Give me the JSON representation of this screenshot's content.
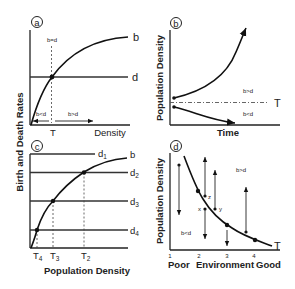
{
  "figure": {
    "shared_ylabel": "Birth and Death Rates",
    "panels": {
      "a": {
        "label": "a",
        "annot_equal": "b=d",
        "annot_less": "b<d",
        "annot_greater": "b>d",
        "curve_b": "b",
        "line_d": "d",
        "threshold": "T",
        "xlabel": "Density"
      },
      "b": {
        "label": "b",
        "ylabel": "Population Density",
        "xlabel": "Time",
        "threshold": "T",
        "annot_greater": "b>d",
        "annot_less": "b<d"
      },
      "c": {
        "label": "c",
        "curve_b": "b",
        "lines": [
          {
            "name": "d",
            "sub": "1"
          },
          {
            "name": "d",
            "sub": "2"
          },
          {
            "name": "d",
            "sub": "3"
          },
          {
            "name": "d",
            "sub": "4"
          }
        ],
        "thresholds": [
          {
            "name": "T",
            "sub": "4"
          },
          {
            "name": "T",
            "sub": "3"
          },
          {
            "name": "T",
            "sub": "2"
          }
        ],
        "xlabel": "Population Density"
      },
      "d": {
        "label": "d",
        "ylabel": "Population Density",
        "ticks": [
          "1",
          "2",
          "3",
          "4"
        ],
        "xlabel_left": "Poor",
        "xlabel_mid": "Environment",
        "xlabel_right": "Good",
        "curve": "T",
        "annot_greater": "b>d",
        "annot_less": "b<d",
        "points": [
          "x",
          "y",
          "z"
        ]
      }
    }
  }
}
